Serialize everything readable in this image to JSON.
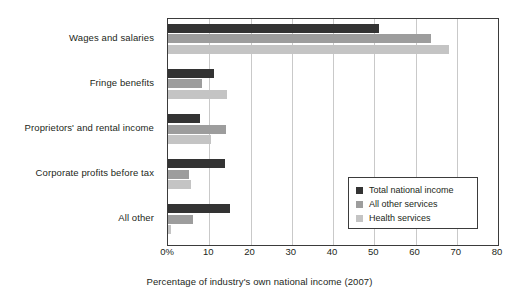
{
  "chart_data": {
    "type": "bar",
    "orientation": "horizontal",
    "title": "",
    "xlabel": "Percentage of industry's own national income (2007)",
    "ylabel": "",
    "xlim": [
      0,
      80
    ],
    "xticks": [
      "0%",
      "10",
      "20",
      "30",
      "40",
      "50",
      "60",
      "70",
      "80"
    ],
    "xtick_values": [
      0,
      10,
      20,
      30,
      40,
      50,
      60,
      70,
      80
    ],
    "grid": true,
    "grid_axis": "x",
    "legend_position": "center-right",
    "categories": [
      "Wages and salaries",
      "Fringe benefits",
      "Proprietors' and rental income",
      "Corporate profits before tax",
      "All other"
    ],
    "series": [
      {
        "name": "Total national income",
        "color": "#333333",
        "values": [
          51.1,
          11.2,
          7.8,
          13.8,
          15.0
        ]
      },
      {
        "name": "All other services",
        "color": "#9d9d9d",
        "values": [
          63.8,
          8.2,
          14.1,
          5.1,
          6.1
        ]
      },
      {
        "name": "Health services",
        "color": "#c4c4c4",
        "values": [
          68.2,
          14.3,
          10.4,
          5.6,
          0.8
        ]
      }
    ]
  },
  "colors": {
    "series_dark": "#333333",
    "series_medium": "#9d9d9d",
    "series_light": "#c4c4c4",
    "axis": "#3b3b3b",
    "grid": "#c9c9c9",
    "text": "#231f20",
    "background": "#ffffff"
  }
}
